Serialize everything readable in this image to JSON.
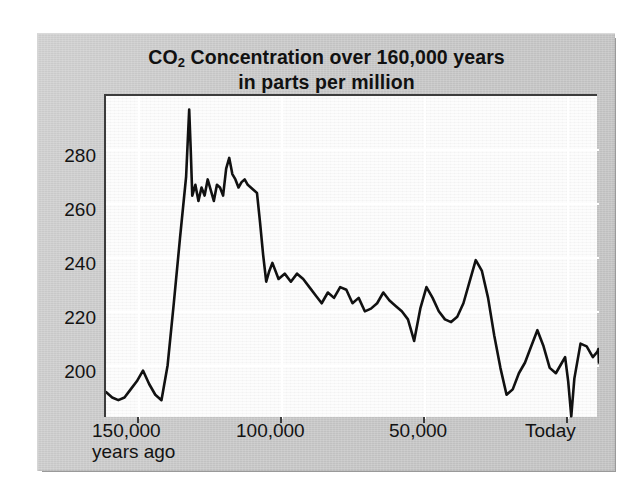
{
  "figure": {
    "title_line1_pre": "CO",
    "title_line1_sub": "2",
    "title_line1_post": " Concentration over 160,000 years",
    "title_line2": "in parts per million",
    "plate_color": "#c9c9c9",
    "plot_background": "#f7f7f7",
    "line_color": "#111111",
    "axis_color": "#3c3c3c"
  },
  "axes": {
    "y_ticks": [
      "280",
      "260",
      "240",
      "220",
      "200"
    ],
    "x_ticks": [
      {
        "label": "150,000",
        "sublabel": "years ago"
      },
      {
        "label": "100,000",
        "sublabel": ""
      },
      {
        "label": "50,000",
        "sublabel": ""
      },
      {
        "label": "Today",
        "sublabel": ""
      }
    ]
  },
  "chart_data": {
    "type": "line",
    "title": "CO2 Concentration over 160,000 years in parts per million",
    "xlabel": "years ago",
    "ylabel": "parts per million",
    "xlim": [
      160000,
      0
    ],
    "ylim": [
      185,
      305
    ],
    "x_tick_values": [
      150000,
      100000,
      50000,
      0
    ],
    "x_tick_labels": [
      "150,000 years ago",
      "100,000",
      "50,000",
      "Today"
    ],
    "y_tick_values": [
      200,
      220,
      240,
      260,
      280
    ],
    "y_tick_labels": [
      "200",
      "220",
      "240",
      "260",
      "280"
    ],
    "grid": true,
    "legend": "none",
    "x_units": "years before present",
    "y_units": "ppm",
    "series": [
      {
        "name": "CO2 concentration",
        "color": "#111111",
        "x": [
          160000,
          158000,
          156000,
          154000,
          152000,
          150000,
          148000,
          146000,
          144000,
          142000,
          140000,
          138000,
          136000,
          134000,
          133000,
          132500,
          132000,
          131000,
          130000,
          129000,
          128000,
          127000,
          126000,
          125000,
          124000,
          123000,
          122000,
          121000,
          120000,
          119000,
          118000,
          117000,
          116000,
          115000,
          114000,
          113000,
          112000,
          111000,
          110000,
          109000,
          108000,
          107000,
          106000,
          104000,
          102000,
          100000,
          98000,
          96000,
          94000,
          92000,
          90000,
          88000,
          86000,
          84000,
          82000,
          80000,
          78000,
          76000,
          74000,
          72000,
          70000,
          68000,
          66000,
          64000,
          62000,
          60000,
          58000,
          56000,
          54000,
          52000,
          50000,
          48000,
          46000,
          44000,
          42000,
          40000,
          38000,
          36000,
          34000,
          32000,
          30000,
          28000,
          26000,
          24000,
          22000,
          20000,
          18000,
          16000,
          14000,
          12000,
          11000,
          10000,
          9000,
          8000,
          6000,
          4000,
          2000,
          500,
          200,
          0
        ],
        "y": [
          195,
          193,
          192,
          193,
          196,
          199,
          203,
          198,
          194,
          192,
          205,
          228,
          252,
          275,
          300,
          285,
          268,
          272,
          266,
          271,
          268,
          274,
          270,
          266,
          272,
          271,
          268,
          278,
          282,
          276,
          274,
          271,
          273,
          274,
          272,
          271,
          270,
          269,
          258,
          246,
          236,
          240,
          243,
          237,
          239,
          236,
          239,
          237,
          234,
          231,
          228,
          232,
          230,
          234,
          233,
          228,
          230,
          225,
          226,
          228,
          232,
          229,
          227,
          225,
          222,
          214,
          226,
          234,
          230,
          225,
          222,
          221,
          223,
          228,
          236,
          244,
          240,
          230,
          216,
          204,
          194,
          196,
          202,
          206,
          212,
          218,
          212,
          204,
          202,
          206,
          208,
          199,
          186,
          200,
          213,
          212,
          208,
          210,
          211,
          206
        ],
        "y_extra_note": "values reconstructed by reading the plotted trace"
      }
    ],
    "annotations": [
      {
        "text": "peak near 300 ppm at ~133,000 years ago"
      },
      {
        "text": "minimum near 186 ppm at ~9,000 years before the modern rise"
      },
      {
        "text": "sharp modern rise to 281 ppm at Today"
      }
    ]
  }
}
